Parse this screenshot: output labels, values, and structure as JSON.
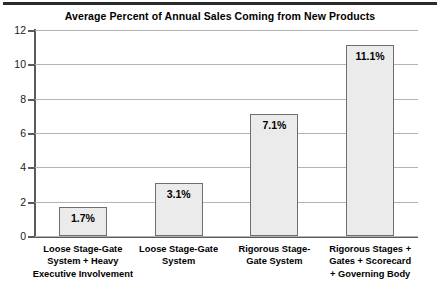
{
  "chart_data": {
    "type": "bar",
    "title": "Average Percent of Annual Sales Coming from New Products",
    "xlabel": "",
    "ylabel": "",
    "ylim": [
      0,
      12
    ],
    "yticks": [
      0,
      2,
      4,
      6,
      8,
      10,
      12
    ],
    "ytick_labels": [
      "0",
      "2",
      "4",
      "6",
      "8",
      "10",
      "12"
    ],
    "grid": true,
    "legend": "none",
    "categories": [
      "Loose Stage-Gate System + Heavy Executive Involvement",
      "Loose Stage-Gate System",
      "Rigorous Stage-Gate System",
      "Rigorous Stages + Gates + Scorecard + Governing Body"
    ],
    "category_lines": [
      [
        "Loose Stage-Gate",
        "System + Heavy",
        "Executive Involvement"
      ],
      [
        "Loose Stage-Gate",
        "System"
      ],
      [
        "Rigorous Stage-",
        "Gate System"
      ],
      [
        "Rigorous Stages +",
        "Gates + Scorecard",
        "+ Governing Body"
      ]
    ],
    "values": [
      1.7,
      3.1,
      7.1,
      11.1
    ],
    "value_labels": [
      "1.7%",
      "3.1%",
      "7.1%",
      "11.1%"
    ],
    "colors": {
      "bar_fill": "#ebebeb",
      "bar_border": "#6e6e6e",
      "gridline": "#b3b3b3",
      "axis": "#5a5a5a",
      "text": "#000000",
      "top_rule": "#2b2b2b",
      "background": "#ffffff"
    }
  }
}
